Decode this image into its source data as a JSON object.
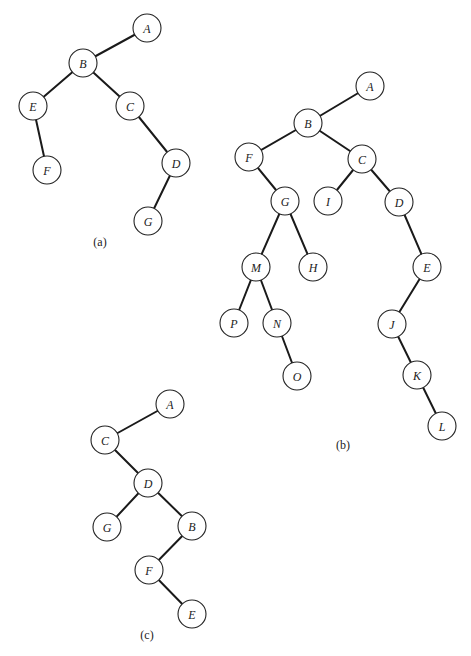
{
  "figure": {
    "node_radius": 14,
    "colors": {
      "background": "#ffffff",
      "edge": "#1a1a1a",
      "node_stroke": "#222222",
      "text": "#222222"
    },
    "trees": [
      {
        "id": "a",
        "caption": "(a)",
        "caption_pos": [
          100,
          242
        ],
        "nodes": [
          {
            "id": "A",
            "label": "A",
            "x": 147,
            "y": 28
          },
          {
            "id": "B",
            "label": "B",
            "x": 83,
            "y": 63
          },
          {
            "id": "E",
            "label": "E",
            "x": 33,
            "y": 106
          },
          {
            "id": "C",
            "label": "C",
            "x": 130,
            "y": 106
          },
          {
            "id": "F",
            "label": "F",
            "x": 47,
            "y": 170
          },
          {
            "id": "D",
            "label": "D",
            "x": 176,
            "y": 163
          },
          {
            "id": "G",
            "label": "G",
            "x": 148,
            "y": 221
          }
        ],
        "edges": [
          [
            "A",
            "B"
          ],
          [
            "B",
            "E"
          ],
          [
            "B",
            "C"
          ],
          [
            "E",
            "F"
          ],
          [
            "C",
            "D"
          ],
          [
            "D",
            "G"
          ]
        ]
      },
      {
        "id": "b",
        "caption": "(b)",
        "caption_pos": [
          343,
          445
        ],
        "nodes": [
          {
            "id": "A",
            "label": "A",
            "x": 370,
            "y": 86
          },
          {
            "id": "B",
            "label": "B",
            "x": 308,
            "y": 123
          },
          {
            "id": "F",
            "label": "F",
            "x": 249,
            "y": 157
          },
          {
            "id": "C",
            "label": "C",
            "x": 362,
            "y": 159
          },
          {
            "id": "G",
            "label": "G",
            "x": 285,
            "y": 201
          },
          {
            "id": "I",
            "label": "I",
            "x": 328,
            "y": 201
          },
          {
            "id": "D",
            "label": "D",
            "x": 399,
            "y": 202
          },
          {
            "id": "M",
            "label": "M",
            "x": 256,
            "y": 267
          },
          {
            "id": "H",
            "label": "H",
            "x": 313,
            "y": 267
          },
          {
            "id": "E",
            "label": "E",
            "x": 427,
            "y": 267
          },
          {
            "id": "P",
            "label": "P",
            "x": 234,
            "y": 323
          },
          {
            "id": "N",
            "label": "N",
            "x": 277,
            "y": 323
          },
          {
            "id": "J",
            "label": "J",
            "x": 392,
            "y": 324
          },
          {
            "id": "O",
            "label": "O",
            "x": 297,
            "y": 376
          },
          {
            "id": "K",
            "label": "K",
            "x": 417,
            "y": 375
          },
          {
            "id": "L",
            "label": "L",
            "x": 442,
            "y": 426
          }
        ],
        "edges": [
          [
            "A",
            "B"
          ],
          [
            "B",
            "F"
          ],
          [
            "B",
            "C"
          ],
          [
            "F",
            "G"
          ],
          [
            "C",
            "I"
          ],
          [
            "C",
            "D"
          ],
          [
            "G",
            "M"
          ],
          [
            "G",
            "H"
          ],
          [
            "D",
            "E"
          ],
          [
            "M",
            "P"
          ],
          [
            "M",
            "N"
          ],
          [
            "N",
            "O"
          ],
          [
            "E",
            "J"
          ],
          [
            "J",
            "K"
          ],
          [
            "K",
            "L"
          ]
        ]
      },
      {
        "id": "c",
        "caption": "(c)",
        "caption_pos": [
          147,
          635
        ],
        "nodes": [
          {
            "id": "A",
            "label": "A",
            "x": 170,
            "y": 404
          },
          {
            "id": "C",
            "label": "C",
            "x": 105,
            "y": 440
          },
          {
            "id": "D",
            "label": "D",
            "x": 148,
            "y": 483
          },
          {
            "id": "G",
            "label": "G",
            "x": 107,
            "y": 527
          },
          {
            "id": "B",
            "label": "B",
            "x": 192,
            "y": 526
          },
          {
            "id": "F",
            "label": "F",
            "x": 149,
            "y": 570
          },
          {
            "id": "E",
            "label": "E",
            "x": 192,
            "y": 614
          }
        ],
        "edges": [
          [
            "A",
            "C"
          ],
          [
            "C",
            "D"
          ],
          [
            "D",
            "G"
          ],
          [
            "D",
            "B"
          ],
          [
            "B",
            "F"
          ],
          [
            "F",
            "E"
          ]
        ]
      }
    ]
  }
}
